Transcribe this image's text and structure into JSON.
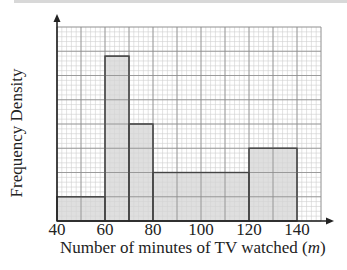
{
  "chart_data": {
    "type": "bar",
    "subtype": "histogram",
    "title": "",
    "xlabel": "Number of minutes of TV watched (m)",
    "ylabel": "Frequency Density",
    "xlim": [
      40,
      150
    ],
    "ylim": [
      0,
      8
    ],
    "x_ticks": [
      40,
      60,
      80,
      100,
      120,
      140
    ],
    "y_ticks": [],
    "grid": true,
    "bins": [
      {
        "from": 40,
        "to": 60,
        "height": 1.0
      },
      {
        "from": 60,
        "to": 70,
        "height": 6.8
      },
      {
        "from": 70,
        "to": 80,
        "height": 4.0
      },
      {
        "from": 80,
        "to": 120,
        "height": 2.0
      },
      {
        "from": 120,
        "to": 140,
        "height": 3.0
      }
    ],
    "categories": [
      "40-60",
      "60-70",
      "70-80",
      "80-120",
      "120-140"
    ],
    "values": [
      1.0,
      6.8,
      4.0,
      2.0,
      3.0
    ],
    "note": "heights in major grid-square units; y-axis unlabeled"
  },
  "labels": {
    "ylabel": "Frequency Density",
    "xlabel_main": "Number of minutes of TV watched (",
    "xlabel_var": "m",
    "xlabel_end": ")",
    "ticks": [
      "40",
      "60",
      "80",
      "100",
      "120",
      "140"
    ]
  },
  "colors": {
    "bar_fill": "#d4d4d4",
    "bar_stroke": "#444444",
    "grid_minor": "#cfcfcf",
    "grid_major": "#8a8a8a",
    "axis": "#222222"
  }
}
